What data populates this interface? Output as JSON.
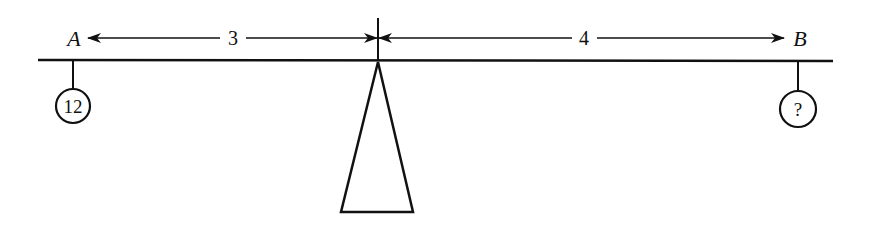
{
  "diagram": {
    "type": "lever-balance",
    "points": {
      "left": {
        "label": "A"
      },
      "right": {
        "label": "B"
      }
    },
    "distances": {
      "left_arm": "3",
      "right_arm": "4"
    },
    "weights": {
      "left": "12",
      "right": "?"
    },
    "colors": {
      "ink": "#111111",
      "background": "#ffffff"
    }
  }
}
